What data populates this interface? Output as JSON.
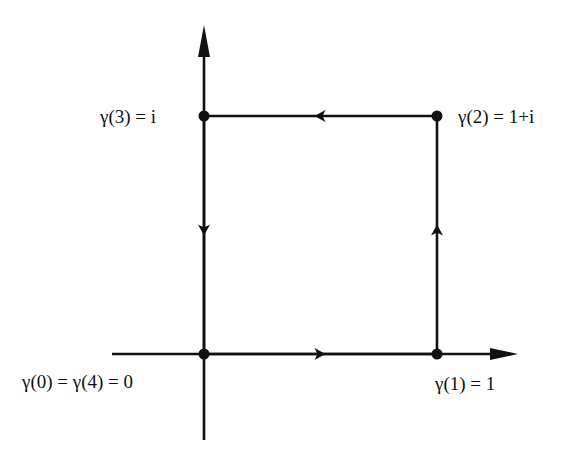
{
  "diagram": {
    "type": "contour-path",
    "colors": {
      "stroke": "#111111",
      "background": "#ffffff"
    },
    "axes": {
      "horizontal": {
        "x1": 112,
        "x2": 518,
        "y": 354
      },
      "vertical": {
        "x": 204,
        "y1": 440,
        "y2": 25
      }
    },
    "points": [
      {
        "id": "gamma0",
        "x": 204,
        "y": 354,
        "label": "γ(0) = γ(4) = 0",
        "lx": 22,
        "ly": 388
      },
      {
        "id": "gamma1",
        "x": 437,
        "y": 354,
        "label": "γ(1) = 1",
        "lx": 435,
        "ly": 390
      },
      {
        "id": "gamma2",
        "x": 437,
        "y": 116,
        "label": "γ(2) = 1+i",
        "lx": 458,
        "ly": 123
      },
      {
        "id": "gamma3",
        "x": 204,
        "y": 116,
        "label": "γ(3) = i",
        "lx": 100,
        "ly": 123
      }
    ],
    "edges": [
      {
        "from": "gamma0",
        "to": "gamma1",
        "arrow": {
          "x": 320,
          "y": 354,
          "dir": "right"
        }
      },
      {
        "from": "gamma1",
        "to": "gamma2",
        "arrow": {
          "x": 437,
          "y": 230,
          "dir": "up"
        }
      },
      {
        "from": "gamma2",
        "to": "gamma3",
        "arrow": {
          "x": 320,
          "y": 116,
          "dir": "left"
        }
      },
      {
        "from": "gamma3",
        "to": "gamma0",
        "arrow": {
          "x": 204,
          "y": 230,
          "dir": "down"
        }
      }
    ]
  }
}
